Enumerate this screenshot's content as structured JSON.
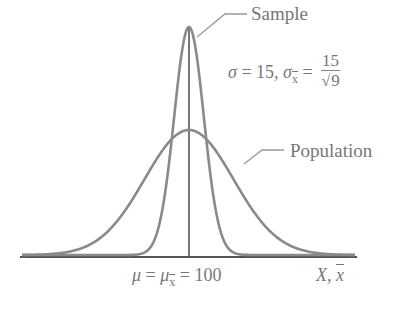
{
  "labels": {
    "sample": "Sample",
    "population": "Population",
    "sigma_sym": "σ",
    "sigma_eq": " = 15, ",
    "sigma_xbar_sym": "σ",
    "sigma_xbar_sub": "x",
    "sigma_xbar_eq": " = ",
    "frac_num": "15",
    "frac_sqrt": "√",
    "frac_den": "9",
    "mu_sym": "μ",
    "mu_eq1": " = ",
    "mu_xbar_sym": "μ",
    "mu_xbar_sub": "x",
    "mu_eq2": " = 100",
    "x_axis_label_X": "X, ",
    "x_axis_label_xbar": "x"
  },
  "colors": {
    "curve": "#8a8a8a",
    "axis": "#555555",
    "text": "#777777",
    "leader": "#999999"
  },
  "chart_data": {
    "type": "line",
    "xlabel": "X, x̄",
    "ylabel": "",
    "mean": 100,
    "annotations": [
      "σ = 15, σx̄ = 15/√9",
      "μ = μx̄ = 100"
    ],
    "series": [
      {
        "name": "Population",
        "mean": 100,
        "sd": 15
      },
      {
        "name": "Sample",
        "mean": 100,
        "sd": 5
      }
    ],
    "xlim": [
      44,
      156
    ],
    "grid": false,
    "legend": "callout labels"
  }
}
